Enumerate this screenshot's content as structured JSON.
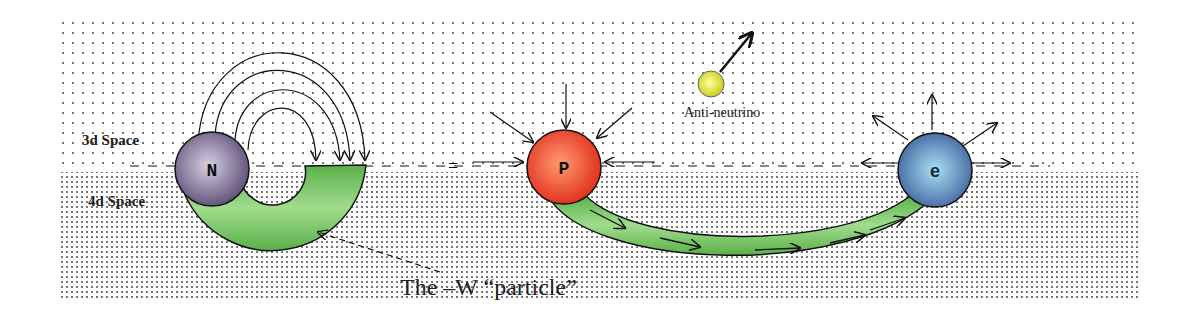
{
  "diagram": {
    "regions": {
      "upper_label": "3d Space",
      "lower_label": "4d Space"
    },
    "particles": {
      "neutron": {
        "label": "N",
        "color": "#6a5a80"
      },
      "proton": {
        "label": "P",
        "color": "#e8402a"
      },
      "electron": {
        "label": "e",
        "color": "#5a7fb8"
      },
      "antineutrino": {
        "label": "Anti-neutrino",
        "color": "#e8e830"
      }
    },
    "caption": "The –W “particle”",
    "colors": {
      "tube_green": "#7cc86a",
      "dot": "#444444"
    }
  }
}
